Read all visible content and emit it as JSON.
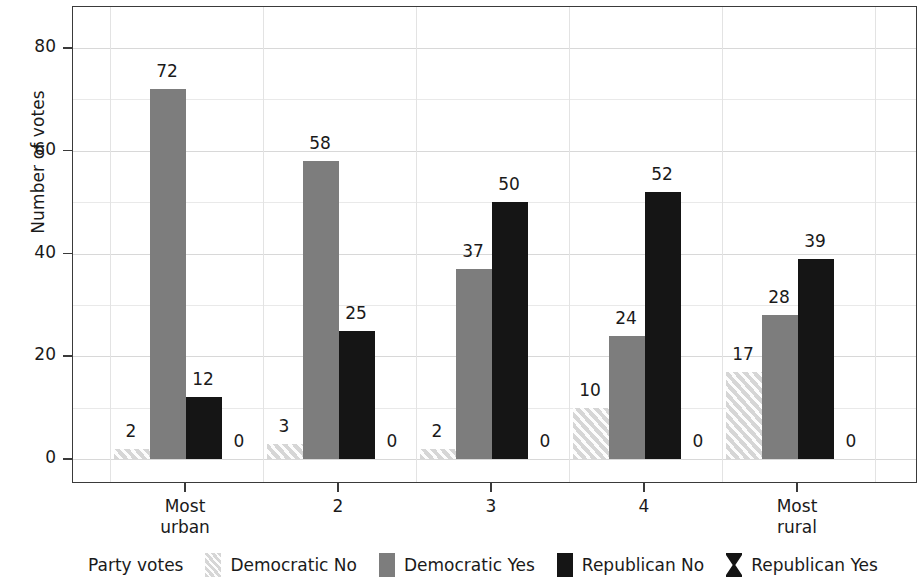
{
  "chart_data": {
    "type": "bar",
    "title": "",
    "xlabel": "",
    "ylabel": "Number of votes",
    "ylim": [
      0,
      88
    ],
    "yticks": [
      0,
      20,
      40,
      60,
      80
    ],
    "yminor": [
      10,
      30,
      50,
      70
    ],
    "grid": true,
    "legend_position": "bottom",
    "legend_title": "Party votes",
    "categories": [
      "Most urban",
      "2",
      "3",
      "4",
      "Most rural"
    ],
    "category_lines": [
      [
        "Most",
        "urban"
      ],
      [
        "2",
        ""
      ],
      [
        "3",
        ""
      ],
      [
        "4",
        ""
      ],
      [
        "Most",
        "rural"
      ]
    ],
    "series": [
      {
        "name": "Democratic No",
        "pattern": "diagonal-hatch-light",
        "color": "#d6d6d6",
        "values": [
          2,
          3,
          2,
          10,
          17
        ]
      },
      {
        "name": "Democratic Yes",
        "pattern": "solid",
        "color": "#7d7d7d",
        "values": [
          72,
          58,
          37,
          24,
          28
        ]
      },
      {
        "name": "Republican No",
        "pattern": "solid",
        "color": "#151515",
        "values": [
          12,
          25,
          50,
          52,
          39
        ]
      },
      {
        "name": "Republican Yes",
        "pattern": "bowtie-cross",
        "color": "#151515",
        "values": [
          0,
          0,
          0,
          0,
          0
        ]
      }
    ]
  },
  "axis": {
    "ylabel": "Number of votes",
    "ytick_labels": [
      "0",
      "20",
      "40",
      "60",
      "80"
    ],
    "xtick_labels": [
      "Most urban",
      "2",
      "3",
      "4",
      "Most rural"
    ]
  },
  "legend": {
    "title": "Party votes",
    "items": [
      {
        "label": "Democratic No"
      },
      {
        "label": "Democratic Yes"
      },
      {
        "label": "Republican No"
      },
      {
        "label": "Republican Yes"
      }
    ]
  }
}
